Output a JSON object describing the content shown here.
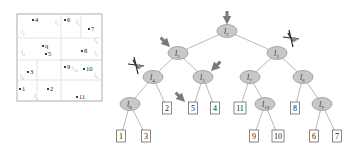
{
  "partition_panel": {
    "points": [
      {
        "label": "4",
        "x": 33,
        "y": 20
      },
      {
        "label": "6",
        "x": 65,
        "y": 20
      },
      {
        "label": "7",
        "x": 89,
        "y": 29
      },
      {
        "label": "q",
        "x": 43,
        "y": 46
      },
      {
        "label": "5",
        "x": 46,
        "y": 54
      },
      {
        "label": "8",
        "x": 82,
        "y": 51
      },
      {
        "label": "9",
        "x": 65,
        "y": 67
      },
      {
        "label": "10",
        "x": 84,
        "y": 69
      },
      {
        "label": "3",
        "x": 28,
        "y": 72
      },
      {
        "label": "1",
        "x": 20,
        "y": 89
      },
      {
        "label": "2",
        "x": 48,
        "y": 89
      },
      {
        "label": "11",
        "x": 77,
        "y": 97
      }
    ],
    "region_labels": [
      {
        "text": "l",
        "sub": "2",
        "x": 21,
        "y": 34
      },
      {
        "text": "l",
        "sub": "4",
        "x": 21,
        "y": 54
      },
      {
        "text": "l",
        "sub": "8",
        "x": 20,
        "y": 78
      },
      {
        "text": "l",
        "sub": "5",
        "x": 55,
        "y": 24
      },
      {
        "text": "l",
        "sub": "1",
        "x": 34,
        "y": 98
      },
      {
        "text": "l",
        "sub": "3",
        "x": 76,
        "y": 24
      },
      {
        "text": "l",
        "sub": "6",
        "x": 94,
        "y": 42
      },
      {
        "text": "l",
        "sub": "7",
        "x": 94,
        "y": 55
      },
      {
        "text": "l",
        "sub": "10",
        "x": 72,
        "y": 70
      },
      {
        "text": "l",
        "sub": "9",
        "x": 94,
        "y": 77
      }
    ]
  },
  "tree": {
    "internal_nodes": [
      {
        "id": "l1",
        "label": "l",
        "sub": "1",
        "x": 227,
        "y": 31
      },
      {
        "id": "l2",
        "label": "l",
        "sub": "2",
        "x": 178,
        "y": 53
      },
      {
        "id": "l3",
        "label": "l",
        "sub": "3",
        "x": 277,
        "y": 53
      },
      {
        "id": "l4",
        "label": "l",
        "sub": "4",
        "x": 153,
        "y": 77
      },
      {
        "id": "l5",
        "label": "l",
        "sub": "5",
        "x": 203,
        "y": 77
      },
      {
        "id": "l7",
        "label": "l",
        "sub": "7",
        "x": 250,
        "y": 77
      },
      {
        "id": "l6",
        "label": "l",
        "sub": "6",
        "x": 303,
        "y": 77
      },
      {
        "id": "l8",
        "label": "l",
        "sub": "8",
        "x": 130,
        "y": 104
      },
      {
        "id": "l10",
        "label": "l",
        "sub": "10",
        "x": 265,
        "y": 104
      },
      {
        "id": "l9",
        "label": "l",
        "sub": "9",
        "x": 322,
        "y": 104
      }
    ],
    "leaf_nodes": [
      {
        "label": "2",
        "x": 167,
        "y": 108
      },
      {
        "label": "5",
        "x": 193,
        "y": 108
      },
      {
        "label": "4",
        "x": 215,
        "y": 108
      },
      {
        "label": "11",
        "x": 240,
        "y": 108
      },
      {
        "label": "8",
        "x": 295,
        "y": 108
      },
      {
        "label": "1",
        "x": 121,
        "y": 136
      },
      {
        "label": "3",
        "x": 146,
        "y": 136
      },
      {
        "label": "9",
        "x": 254,
        "y": 136
      },
      {
        "label": "10",
        "x": 278,
        "y": 136
      },
      {
        "label": "6",
        "x": 314,
        "y": 136
      },
      {
        "label": "7",
        "x": 337,
        "y": 136
      }
    ],
    "edges": [
      [
        "l1",
        "l2"
      ],
      [
        "l1",
        "l3"
      ],
      [
        "l2",
        "l4"
      ],
      [
        "l2",
        "l5"
      ],
      [
        "l3",
        "l7"
      ],
      [
        "l3",
        "l6"
      ],
      [
        "l4",
        "l8"
      ],
      [
        "l4",
        "leaf:2"
      ],
      [
        "l5",
        "leaf:5"
      ],
      [
        "l5",
        "leaf:4"
      ],
      [
        "l7",
        "leaf:11"
      ],
      [
        "l7",
        "l10"
      ],
      [
        "l6",
        "leaf:8"
      ],
      [
        "l6",
        "l9"
      ],
      [
        "l8",
        "leaf:1"
      ],
      [
        "l8",
        "leaf:3"
      ],
      [
        "l10",
        "leaf:9"
      ],
      [
        "l10",
        "leaf:10"
      ],
      [
        "l9",
        "leaf:6"
      ],
      [
        "l9",
        "leaf:7"
      ]
    ],
    "visit_arrows": [
      {
        "target": "l1",
        "dir": "down"
      },
      {
        "target": "l2",
        "dir": "down-right"
      },
      {
        "target": "l5",
        "dir": "down-left"
      },
      {
        "target": "leaf:5",
        "dir": "down-right"
      }
    ],
    "pruned_marks": [
      {
        "near": "l3",
        "x": 291,
        "y": 38
      },
      {
        "near": "l4",
        "x": 136,
        "y": 65
      }
    ]
  },
  "colors": {
    "node_fill": "#c8c8c8",
    "node_stroke": "#8a8a8a",
    "edge": "#9a9a9a",
    "arrow": "#7a7a7a",
    "panel_border": "#9a9a9a",
    "panel_grid": "#d8d8d8"
  }
}
